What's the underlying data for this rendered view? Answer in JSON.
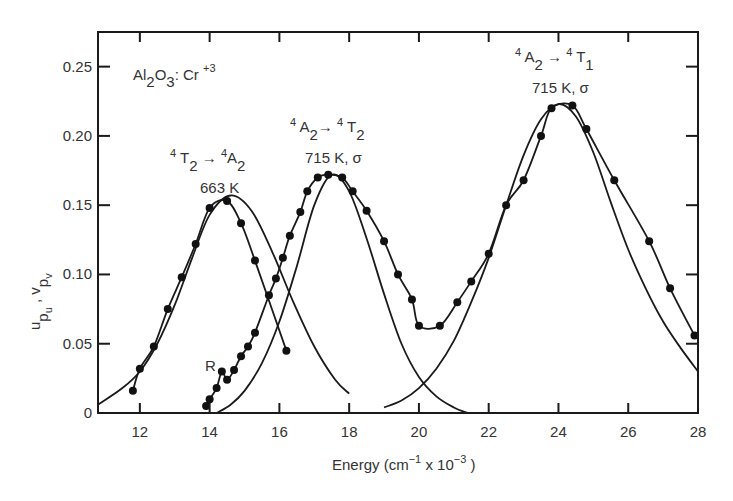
{
  "chart_data": {
    "type": "line",
    "title": "",
    "xlabel": "Energy (cm⁻¹ x 10⁻³)",
    "ylabel": "u p_u , v p_v",
    "xlim": [
      10.8,
      28
    ],
    "ylim": [
      0,
      0.275
    ],
    "grid": false,
    "legend": "none",
    "x_ticks": [
      "12",
      "14",
      "16",
      "18",
      "20",
      "22",
      "24",
      "26",
      "28"
    ],
    "y_ticks": [
      "0",
      "0.05",
      "0.10",
      "0.15",
      "0.20",
      "0.25"
    ],
    "annotations": [
      {
        "text": "Al2O3 : Cr +3",
        "role": "sample-label"
      },
      {
        "text": "4T2 → 4A2",
        "sub": "663 K",
        "role": "emission-band"
      },
      {
        "text": "4A2 → 4T2",
        "sub": "715 K, σ",
        "role": "absorption-band-1"
      },
      {
        "text": "4A2 → 4T1",
        "sub": "715 K, σ",
        "role": "absorption-band-2"
      },
      {
        "text": "R",
        "role": "R-line-marker"
      }
    ],
    "series": [
      {
        "name": "Emission 4T2→4A2 measured (663 K)",
        "style": "points+line",
        "x": [
          11.8,
          12.0,
          12.4,
          12.8,
          13.2,
          13.6,
          14.0,
          14.5,
          14.9,
          15.3,
          16.2
        ],
        "y": [
          0.016,
          0.032,
          0.048,
          0.075,
          0.098,
          0.122,
          0.148,
          0.153,
          0.137,
          0.11,
          0.045
        ]
      },
      {
        "name": "Emission 4T2→4A2 fit",
        "style": "line",
        "x": [
          10.8,
          11.5,
          12.0,
          12.5,
          13.0,
          13.5,
          14.0,
          14.6,
          15.2,
          15.8,
          16.4,
          17.0,
          17.6,
          18.0
        ],
        "y": [
          0.006,
          0.018,
          0.03,
          0.05,
          0.078,
          0.112,
          0.143,
          0.157,
          0.146,
          0.116,
          0.08,
          0.048,
          0.024,
          0.014
        ]
      },
      {
        "name": "Absorption 4A2→4T2 + 4T1 measured (715 K, σ)",
        "style": "points+line",
        "x": [
          13.9,
          14.0,
          14.2,
          14.35,
          14.5,
          14.7,
          14.9,
          15.1,
          15.3,
          15.7,
          15.9,
          16.1,
          16.3,
          16.6,
          16.8,
          17.1,
          17.4,
          17.8,
          18.1,
          18.5,
          19.0,
          19.4,
          19.8,
          20.0,
          20.6,
          21.1,
          21.5,
          22.0,
          22.5,
          23.0,
          23.5,
          23.8,
          24.4,
          24.8,
          25.6,
          26.6,
          27.2,
          27.9
        ],
        "y": [
          0.005,
          0.01,
          0.018,
          0.03,
          0.024,
          0.031,
          0.041,
          0.048,
          0.058,
          0.085,
          0.097,
          0.112,
          0.128,
          0.145,
          0.16,
          0.17,
          0.172,
          0.17,
          0.16,
          0.146,
          0.124,
          0.1,
          0.082,
          0.063,
          0.063,
          0.08,
          0.095,
          0.115,
          0.15,
          0.168,
          0.2,
          0.22,
          0.222,
          0.205,
          0.168,
          0.124,
          0.09,
          0.056
        ]
      },
      {
        "name": "Absorption 4A2→4T2 fit",
        "style": "line",
        "x": [
          14.2,
          14.6,
          15.0,
          15.5,
          16.0,
          16.5,
          17.0,
          17.5,
          18.0,
          18.5,
          19.0,
          19.5,
          20.0,
          20.5,
          21.0,
          21.4
        ],
        "y": [
          0.0,
          0.006,
          0.016,
          0.036,
          0.066,
          0.106,
          0.15,
          0.172,
          0.16,
          0.126,
          0.086,
          0.05,
          0.026,
          0.012,
          0.004,
          0.0
        ]
      },
      {
        "name": "Absorption 4A2→4T1 fit",
        "style": "line",
        "x": [
          19.0,
          19.5,
          20.0,
          20.5,
          21.0,
          21.5,
          22.0,
          22.5,
          23.0,
          23.5,
          24.0,
          24.5,
          25.0,
          25.5,
          26.0,
          26.5,
          27.0,
          27.5,
          28.0
        ],
        "y": [
          0.004,
          0.009,
          0.018,
          0.032,
          0.052,
          0.08,
          0.112,
          0.15,
          0.186,
          0.212,
          0.223,
          0.214,
          0.188,
          0.152,
          0.118,
          0.09,
          0.066,
          0.047,
          0.03
        ]
      }
    ]
  }
}
